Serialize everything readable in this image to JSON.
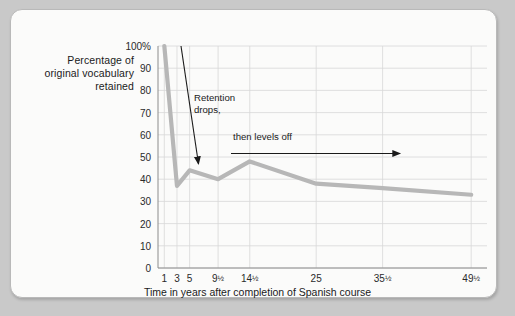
{
  "chart_data": {
    "type": "line",
    "title": "",
    "xlabel": "Time in years after completion of Spanish course",
    "ylabel": "Percentage of original vocabulary retained",
    "x_categories": [
      "1",
      "3",
      "5",
      "9½",
      "14½",
      "25",
      "35½",
      "49½"
    ],
    "x_positions": [
      1,
      3,
      5,
      9.5,
      14.5,
      25,
      35.5,
      49.5
    ],
    "values": [
      100,
      37,
      44,
      40,
      48,
      38,
      36,
      33
    ],
    "xlim": [
      0,
      52
    ],
    "ylim": [
      0,
      100
    ],
    "ytick_values": [
      0,
      10,
      20,
      30,
      40,
      50,
      60,
      70,
      80,
      90,
      100
    ],
    "ytick_labels": [
      "0",
      "10",
      "20",
      "30",
      "40",
      "50",
      "60",
      "70",
      "80",
      "90",
      "100%"
    ],
    "grid": true,
    "legend": "none",
    "line_color": "#b7b7b7",
    "grid_color": "#d8d8d8",
    "axis_color": "#8c8c8c",
    "annotations": [
      {
        "name": "retention-drops",
        "text": "Retention\ndrops,"
      },
      {
        "name": "then-levels-off",
        "text": "then levels off"
      }
    ]
  },
  "axis": {
    "ylabel_line1": "Percentage of",
    "ylabel_line2": "original vocabulary",
    "ylabel_line3": "retained",
    "xtitle": "Time in years after completion of Spanish course"
  },
  "annotations": {
    "retention_drops": "Retention\ndrops,",
    "then_levels_off": "then levels off"
  },
  "colors": {
    "line": "#b7b7b7",
    "grid": "#d8d8d8",
    "axis": "#8c8c8c",
    "background": "#fbfbfa",
    "page": "#c9c9c9",
    "text": "#1a1a1a"
  }
}
